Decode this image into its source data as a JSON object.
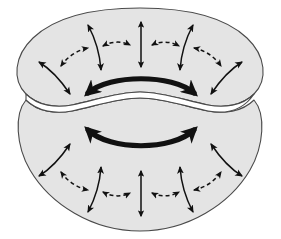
{
  "figure": {
    "width": 281,
    "height": 239,
    "background_color": "#ffffff"
  },
  "style": {
    "body_fill": "#e4e4e4",
    "body_stroke": "#4a4a4a",
    "body_stroke_width": 1.1,
    "hole_fill": "#ffffff",
    "arrow_color": "#111111",
    "thin_arrow_width": 1.5,
    "dashed_arrow_width": 1.5,
    "dash_pattern": "4,3",
    "bold_arrow_width": 5.2
  },
  "shapes": [
    {
      "name": "upper-lobe",
      "label": "Upper torus lobe",
      "path": "M 140 8 C 96 8 56 16 33 38 C 14 56 12 80 26 94 C 38 106 56 108 72 105 C 96 100 118 92 140 92 C 162 92 184 100 208 105 C 224 108 242 106 254 94 C 268 80 266 56 247 38 C 224 16 184 8 140 8 Z"
    },
    {
      "name": "lower-lobe",
      "label": "Lower torus lobe",
      "path": "M 140 98 C 118 98 96 106 72 111 C 56 114 38 112 26 100 C 14 114 16 146 30 170 C 50 204 92 231 140 231 C 188 231 230 204 250 170 C 264 146 266 114 254 100 C 242 112 224 114 208 111 C 184 106 162 98 140 98 Z"
    },
    {
      "name": "central-hole",
      "label": "Lens shaped central opening",
      "path": "M 26 94 C 38 106 56 108 72 105 C 96 100 118 92 140 92 C 162 92 184 100 208 105 C 224 108 242 106 254 94 C 242 112 224 114 208 111 C 184 106 162 98 140 98 C 118 98 96 106 72 111 C 56 114 38 112 26 100 Z"
    }
  ],
  "arrows": {
    "bold": [
      {
        "name": "bold-arrow-upper",
        "style": "solid-bold",
        "heads": "double",
        "orientation": "horizontal-arc-up",
        "path": "M 88 93 C 110 74 172 74 194 93"
      },
      {
        "name": "bold-arrow-lower",
        "style": "solid-bold",
        "heads": "double",
        "orientation": "horizontal-arc-down",
        "path": "M 88 130 C 110 151 172 151 194 130"
      }
    ],
    "vertical": [
      {
        "name": "vertical-double-arrow-upper",
        "style": "solid-thin",
        "heads": "double",
        "path": "M 141 22 L 141 67"
      },
      {
        "name": "vertical-double-arrow-lower",
        "style": "solid-thin",
        "heads": "double",
        "path": "M 141 171 L 141 216"
      }
    ],
    "dashed": [
      {
        "name": "dashed-arrow-upper-center-left",
        "path": "M 103 46 C 112 41 122 41 130 45"
      },
      {
        "name": "dashed-arrow-upper-center-right",
        "path": "M 152 45 C 160 41 170 41 179 46"
      },
      {
        "name": "dashed-arrow-upper-left",
        "path": "M 61 66 C 68 56 78 50 88 48"
      },
      {
        "name": "dashed-arrow-upper-right",
        "path": "M 194 48 C 204 50 214 56 221 66"
      },
      {
        "name": "dashed-arrow-lower-center-left",
        "path": "M 103 192 C 112 197 122 197 130 193"
      },
      {
        "name": "dashed-arrow-lower-center-right",
        "path": "M 152 193 C 160 197 170 197 179 192"
      },
      {
        "name": "dashed-arrow-lower-left",
        "path": "M 61 172 C 68 182 78 188 88 190"
      },
      {
        "name": "dashed-arrow-lower-right",
        "path": "M 194 190 C 204 188 214 182 221 172"
      }
    ],
    "curved": [
      {
        "name": "curved-arrow-upper-inner-left",
        "heads": "double",
        "path": "M 88 25 C 96 40 100 55 101 70"
      },
      {
        "name": "curved-arrow-upper-inner-right",
        "heads": "double",
        "path": "M 193 25 C 185 40 181 55 180 70"
      },
      {
        "name": "curved-arrow-upper-outer-left",
        "heads": "double",
        "path": "M 39 62 C 52 70 62 82 70 94"
      },
      {
        "name": "curved-arrow-upper-outer-right",
        "heads": "double",
        "path": "M 242 62 C 229 70 219 82 211 94"
      },
      {
        "name": "curved-arrow-lower-inner-left",
        "heads": "double",
        "path": "M 88 212 C 96 197 100 182 101 167"
      },
      {
        "name": "curved-arrow-lower-inner-right",
        "heads": "double",
        "path": "M 193 212 C 185 197 181 182 180 167"
      },
      {
        "name": "curved-arrow-lower-outer-left",
        "heads": "double",
        "path": "M 39 176 C 52 168 62 156 70 144"
      },
      {
        "name": "curved-arrow-lower-outer-right",
        "heads": "double",
        "path": "M 242 176 C 229 168 219 156 211 144"
      }
    ]
  }
}
